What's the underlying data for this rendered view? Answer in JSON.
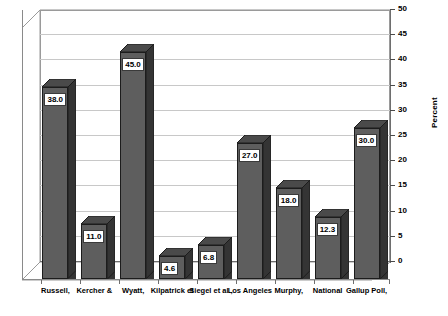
{
  "chart_data": {
    "type": "bar",
    "title": "",
    "xlabel": "",
    "ylabel": "Percent",
    "ylim": [
      0,
      50
    ],
    "ytick_step": 5,
    "yticks": [
      0,
      5,
      10,
      15,
      20,
      25,
      30,
      35,
      40,
      45,
      50
    ],
    "grid": true,
    "legend": "none",
    "style": "3d-column",
    "categories": [
      "Russell,",
      "Kercher &",
      "Wyatt,",
      "Kilpatrick et",
      "Siegel et al.,",
      "Los Angeles",
      "Murphy,",
      "National",
      "Gallup Poll,"
    ],
    "values": [
      38.0,
      11.0,
      45.0,
      4.6,
      6.8,
      27.0,
      18.0,
      12.3,
      30.0
    ],
    "data_labels": [
      "38.0",
      "11.0",
      "45.0",
      "4.6",
      "6.8",
      "27.0",
      "18.0",
      "12.3",
      "30.0"
    ]
  },
  "colors": {
    "bar_front": "#5e5e5e",
    "bar_side": "#343434",
    "bar_top": "#4a4a4a",
    "bar_outline": "#1c1c1c",
    "grid": "#c8c8c8",
    "axis": "#6e6e6e",
    "background": "#ffffff",
    "label_box": "#ffffff",
    "text": "#000000"
  }
}
